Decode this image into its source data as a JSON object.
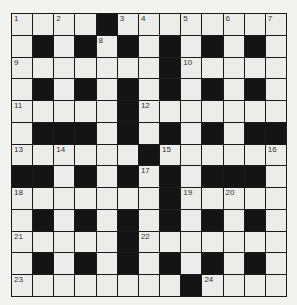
{
  "puzzle": {
    "rows": 13,
    "cols": 13,
    "colors": {
      "background": "#f2f2f0",
      "white_cell": "#ececea",
      "black_cell": "#141414",
      "grid_line": "#1a1a1a",
      "number_text": "#333333"
    },
    "grid": [
      "WWWWBWWWWWWWW",
      "WBWBWBWBWBWBW",
      "WWWWWWWBWWWWW",
      "WBWBWBWBWBWBW",
      "WWWWWBWWWWWWW",
      "WBBBWBWBWBWBB",
      "WWWWWWBWWWWWW",
      "BBWBWBWBWBBBW",
      "WWWWWWWBWWWWW",
      "WBWBWBWBWBWBW",
      "WWWWWBWWWWWWW",
      "WBWBWBWBWBWBW",
      "WWWWWWWWBWWWW"
    ],
    "numbers": [
      {
        "r": 0,
        "c": 0,
        "n": "1"
      },
      {
        "r": 0,
        "c": 2,
        "n": "2"
      },
      {
        "r": 0,
        "c": 5,
        "n": "3"
      },
      {
        "r": 0,
        "c": 6,
        "n": "4"
      },
      {
        "r": 0,
        "c": 8,
        "n": "5"
      },
      {
        "r": 0,
        "c": 10,
        "n": "6"
      },
      {
        "r": 0,
        "c": 12,
        "n": "7"
      },
      {
        "r": 1,
        "c": 4,
        "n": "8"
      },
      {
        "r": 2,
        "c": 0,
        "n": "9"
      },
      {
        "r": 2,
        "c": 8,
        "n": "10"
      },
      {
        "r": 4,
        "c": 0,
        "n": "11"
      },
      {
        "r": 4,
        "c": 6,
        "n": "12"
      },
      {
        "r": 6,
        "c": 0,
        "n": "13"
      },
      {
        "r": 6,
        "c": 2,
        "n": "14"
      },
      {
        "r": 6,
        "c": 7,
        "n": "15"
      },
      {
        "r": 6,
        "c": 12,
        "n": "16"
      },
      {
        "r": 7,
        "c": 6,
        "n": "17"
      },
      {
        "r": 8,
        "c": 0,
        "n": "18"
      },
      {
        "r": 8,
        "c": 8,
        "n": "19"
      },
      {
        "r": 8,
        "c": 10,
        "n": "20"
      },
      {
        "r": 10,
        "c": 0,
        "n": "21"
      },
      {
        "r": 10,
        "c": 6,
        "n": "22"
      },
      {
        "r": 12,
        "c": 0,
        "n": "23"
      },
      {
        "r": 12,
        "c": 9,
        "n": "24"
      }
    ]
  }
}
